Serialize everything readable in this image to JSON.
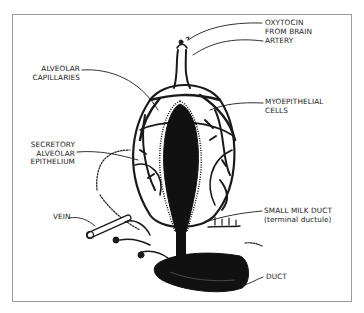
{
  "diagram": {
    "labels": {
      "oxytocin": [
        "OXYTOCIN",
        "FROM BRAIN"
      ],
      "artery": [
        "ARTERY"
      ],
      "alveolar_capillaries": [
        "ALVEOLAR",
        "CAPILLARIES"
      ],
      "myoepithelial": [
        "MYOEPITHELIAL",
        "CELLS"
      ],
      "secretory": [
        "SECRETORY",
        "ALVEOLAR",
        "EPITHELIUM"
      ],
      "vein": [
        "VEIN"
      ],
      "small_milk_duct": [
        "SMALL MILK DUCT",
        "(terminal ductule)"
      ],
      "duct": [
        "DUCT"
      ]
    },
    "colors": {
      "ink": "#1a1a1a",
      "frame": "#9a9a9a",
      "background": "#ffffff"
    }
  }
}
